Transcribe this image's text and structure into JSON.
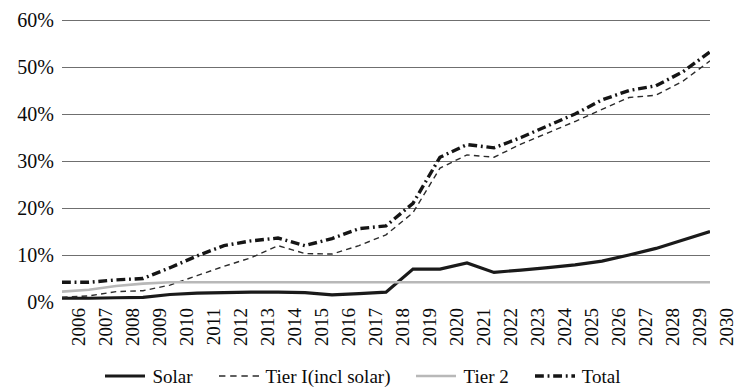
{
  "chart_data": {
    "type": "line",
    "title": "",
    "subtitle": "",
    "xlabel": "",
    "ylabel": "",
    "grid": true,
    "legend_position": "bottom",
    "ylim": [
      0,
      60
    ],
    "ytick_labels": [
      "60%",
      "50%",
      "40%",
      "30%",
      "20%",
      "10%",
      "0%"
    ],
    "ytick_values": [
      60,
      50,
      40,
      30,
      20,
      10,
      0
    ],
    "categories": [
      "2006",
      "2007",
      "2008",
      "2009",
      "2010",
      "2011",
      "2012",
      "2013",
      "2014",
      "2015",
      "2016",
      "2017",
      "2018",
      "2019",
      "2020",
      "2021",
      "2022",
      "2023",
      "2024",
      "2025",
      "2026",
      "2027",
      "2028",
      "2029",
      "2030"
    ],
    "series": [
      {
        "name": "Solar",
        "style": "solid",
        "color": "#1a1a1a",
        "width": 3.2,
        "values": [
          0.8,
          0.8,
          0.9,
          1.0,
          1.6,
          1.9,
          2.0,
          2.1,
          2.1,
          2.0,
          1.5,
          1.8,
          2.1,
          7.0,
          7.0,
          8.3,
          6.3,
          6.8,
          7.3,
          7.9,
          8.7,
          10.0,
          11.4,
          13.2,
          15.0
        ]
      },
      {
        "name": "Tier I(incl solar)",
        "style": "dashed",
        "color": "#2b2b2b",
        "width": 1.4,
        "values": [
          1.0,
          1.3,
          2.2,
          2.4,
          3.6,
          5.6,
          7.6,
          9.4,
          12.0,
          10.3,
          10.2,
          12.0,
          14.3,
          19.0,
          28.5,
          31.3,
          30.8,
          33.6,
          36.0,
          38.4,
          41.0,
          43.5,
          44.0,
          47.0,
          51.3
        ]
      },
      {
        "name": "Tier 2",
        "style": "solid",
        "color": "#b8b8b8",
        "width": 2.6,
        "values": [
          2.2,
          2.6,
          3.4,
          3.9,
          4.2,
          4.2,
          4.2,
          4.2,
          4.2,
          4.2,
          4.2,
          4.2,
          4.2,
          4.2,
          4.2,
          4.2,
          4.2,
          4.2,
          4.2,
          4.2,
          4.2,
          4.2,
          4.2,
          4.2,
          4.2
        ]
      },
      {
        "name": "Total",
        "style": "dashdot",
        "color": "#151515",
        "width": 3.4,
        "values": [
          4.2,
          4.2,
          4.7,
          5.0,
          7.3,
          9.8,
          12.0,
          13.0,
          13.6,
          12.0,
          13.5,
          15.6,
          16.2,
          21.0,
          30.8,
          33.5,
          32.8,
          35.0,
          37.5,
          40.0,
          43.0,
          45.0,
          46.0,
          49.0,
          53.2
        ]
      }
    ]
  },
  "y_axis": {
    "ticks": [
      {
        "label": "60%",
        "value": 60
      },
      {
        "label": "50%",
        "value": 50
      },
      {
        "label": "40%",
        "value": 40
      },
      {
        "label": "30%",
        "value": 30
      },
      {
        "label": "20%",
        "value": 20
      },
      {
        "label": "10%",
        "value": 10
      },
      {
        "label": "0%",
        "value": 0
      }
    ]
  },
  "x_axis": {
    "ticks": [
      "2006",
      "2007",
      "2008",
      "2009",
      "2010",
      "2011",
      "2012",
      "2013",
      "2014",
      "2015",
      "2016",
      "2017",
      "2018",
      "2019",
      "2020",
      "2021",
      "2022",
      "2023",
      "2024",
      "2025",
      "2026",
      "2027",
      "2028",
      "2029",
      "2030"
    ]
  },
  "legend": {
    "items": [
      {
        "label": "Solar",
        "style": "solid",
        "color": "#1a1a1a",
        "width": 3.2
      },
      {
        "label": "Tier I(incl solar)",
        "style": "dashed",
        "color": "#2b2b2b",
        "width": 1.6
      },
      {
        "label": "Tier 2",
        "style": "solid",
        "color": "#b8b8b8",
        "width": 2.6
      },
      {
        "label": "Total",
        "style": "dashdot",
        "color": "#151515",
        "width": 3.4
      }
    ]
  },
  "style": {
    "gridline_color": "#6f6f6f",
    "background": "#ffffff",
    "text_color": "#0a0a0a"
  }
}
